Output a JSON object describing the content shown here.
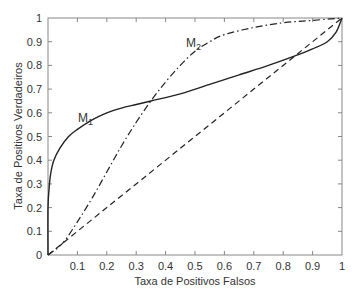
{
  "chart_data": {
    "type": "line",
    "title": "",
    "xlabel": "Taxa de Positivos Falsos",
    "ylabel": "Taxa de Positivos Verdadeiros",
    "xlim": [
      0,
      1
    ],
    "ylim": [
      0,
      1
    ],
    "grid": false,
    "legend": "none (inline curve labels)",
    "x_ticks": [
      "0.1",
      "0.2",
      "0.3",
      "0.4",
      "0.5",
      "0.6",
      "0.7",
      "0.8",
      "0.9",
      "1"
    ],
    "y_ticks": [
      "0",
      "0.1",
      "0.2",
      "0.3",
      "0.4",
      "0.5",
      "0.6",
      "0.7",
      "0.8",
      "0.9",
      "1"
    ],
    "series": [
      {
        "name": "M1",
        "style": "solid",
        "x": [
          0,
          0,
          0.005,
          0.01,
          0.02,
          0.04,
          0.07,
          0.1,
          0.15,
          0.2,
          0.25,
          0.3,
          0.35,
          0.45,
          0.55,
          0.65,
          0.75,
          0.84,
          0.9,
          0.95,
          0.98,
          1.0
        ],
        "y": [
          0,
          0.2,
          0.3,
          0.35,
          0.4,
          0.45,
          0.5,
          0.53,
          0.57,
          0.6,
          0.62,
          0.635,
          0.65,
          0.68,
          0.72,
          0.76,
          0.8,
          0.84,
          0.87,
          0.9,
          0.94,
          1.0
        ]
      },
      {
        "name": "M2",
        "style": "dash-dot",
        "x": [
          0,
          0.05,
          0.1,
          0.15,
          0.2,
          0.25,
          0.3,
          0.35,
          0.4,
          0.45,
          0.5,
          0.55,
          0.6,
          0.7,
          0.8,
          0.9,
          1.0
        ],
        "y": [
          0,
          0.05,
          0.14,
          0.24,
          0.35,
          0.46,
          0.56,
          0.65,
          0.73,
          0.8,
          0.86,
          0.9,
          0.93,
          0.96,
          0.98,
          0.99,
          1.0
        ]
      },
      {
        "name": "Random (diagonal)",
        "style": "dashed",
        "x": [
          0,
          1
        ],
        "y": [
          0,
          1
        ]
      }
    ],
    "annotations": [
      {
        "text": "M",
        "sub": "1",
        "x": 0.1,
        "y": 0.58
      },
      {
        "text": "M",
        "sub": "2",
        "x": 0.48,
        "y": 0.92
      }
    ],
    "intersections": [
      {
        "x": 0.35,
        "y": 0.65
      },
      {
        "x": 0.84,
        "y": 0.84
      }
    ]
  },
  "labels": {
    "m1_main": "M",
    "m1_sub": "1",
    "m2_main": "M",
    "m2_sub": "2",
    "xlabel": "Taxa de Positivos Falsos",
    "ylabel": "Taxa de Positivos Verdadeiros",
    "x0": "0",
    "x1": "0.1",
    "x2": "0.2",
    "x3": "0.3",
    "x4": "0.4",
    "x5": "0.5",
    "x6": "0.6",
    "x7": "0.7",
    "x8": "0.8",
    "x9": "0.9",
    "x10": "1",
    "y0": "0",
    "y1": "0.1",
    "y2": "0.2",
    "y3": "0.3",
    "y4": "0.4",
    "y5": "0.5",
    "y6": "0.6",
    "y7": "0.7",
    "y8": "0.8",
    "y9": "0.9",
    "y10": "1"
  }
}
